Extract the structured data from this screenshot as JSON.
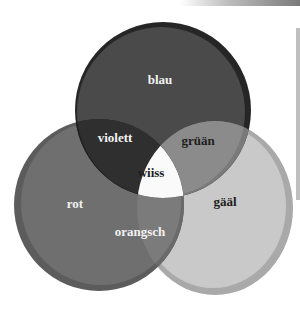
{
  "diagram": {
    "type": "venn",
    "sets": [
      {
        "id": "blau",
        "label": "blau",
        "color": "#4a4a4a",
        "rim": "#262626"
      },
      {
        "id": "rot",
        "label": "rot",
        "color": "#6f6f6f",
        "rim": "#5c5c5c"
      },
      {
        "id": "gaal",
        "label": "gääl",
        "color": "#c9c9c9",
        "rim": "#a9a9a9"
      }
    ],
    "intersections": [
      {
        "sets": [
          "blau",
          "rot"
        ],
        "label": "violett",
        "color": "#2f2f2f"
      },
      {
        "sets": [
          "blau",
          "gaal"
        ],
        "label": "grüän",
        "color": "#8b8b8b"
      },
      {
        "sets": [
          "rot",
          "gaal"
        ],
        "label": "orangsch",
        "color": "#7b7b7b"
      },
      {
        "sets": [
          "blau",
          "rot",
          "gaal"
        ],
        "label": "wiiss",
        "color": "#fafafa"
      }
    ]
  },
  "labels": {
    "blau": "blau",
    "violett": "violett",
    "gruan": "grüän",
    "wiiss": "wiiss",
    "rot": "rot",
    "orangsch": "orangsch",
    "gaal": "gääl"
  },
  "colors": {
    "label_light": "#f2f2f2",
    "label_dark": "#1e1e1e"
  }
}
